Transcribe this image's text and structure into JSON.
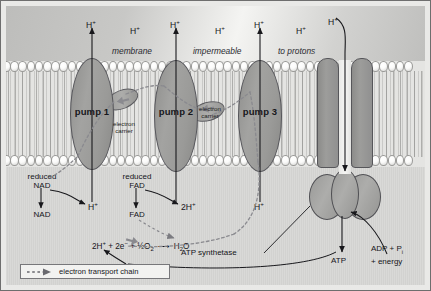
{
  "figure": {
    "colors": {
      "protein_fill": "#9a9a98",
      "protein_stroke": "#55555a",
      "outside_band": "#c8c8c6",
      "matrix_band": "#d5d5d3",
      "membrane_band": "#e4e4e2",
      "text": "#15151a"
    }
  },
  "membrane": {
    "caption_line1": "membrane",
    "caption_line2": "impermeable",
    "caption_line3": "to protons"
  },
  "protons": {
    "outside": [
      {
        "label": "H",
        "charge": "+"
      },
      {
        "label": "H",
        "charge": "+"
      },
      {
        "label": "H",
        "charge": "+"
      },
      {
        "label": "H",
        "charge": "+"
      },
      {
        "label": "H",
        "charge": "+"
      },
      {
        "label": "H",
        "charge": "+"
      },
      {
        "label": "H",
        "charge": "+"
      }
    ],
    "inside": [
      {
        "label": "H",
        "charge": "+"
      },
      {
        "label": "2H",
        "charge": "+"
      },
      {
        "label": "H",
        "charge": "+"
      }
    ]
  },
  "pumps": [
    {
      "name": "pump 1"
    },
    {
      "name": "pump 2"
    },
    {
      "name": "pump 3"
    }
  ],
  "carriers": [
    {
      "line1": "electron",
      "line2": "carrier"
    },
    {
      "line1": "electron",
      "line2": "carrier"
    }
  ],
  "electron": {
    "label": "e",
    "charge": "−"
  },
  "donors": [
    {
      "reduced_line1": "reduced",
      "reduced_line2": "NAD",
      "oxidised": "NAD",
      "product_label": "H",
      "product_charge": "+"
    },
    {
      "reduced_line1": "reduced",
      "reduced_line2": "FAD",
      "oxidised": "FAD",
      "product_label": "2H",
      "product_charge": "+"
    }
  ],
  "water_equation": {
    "reactant1": "2H",
    "reactant1_charge": "+",
    "plus1": "+",
    "reactant2": "2e",
    "reactant2_charge": "−",
    "plus2": "+",
    "reactant3_fraction": "½",
    "reactant3": "O",
    "reactant3_sub": "2",
    "arrow": "⟶",
    "product": "H",
    "product_sub": "2",
    "product_tail": "O"
  },
  "synthetase": {
    "label": "ATP synthetase",
    "output": "ATP",
    "input_line1": "ADP + P",
    "input_sub": "i",
    "input_line2": "+ energy"
  },
  "legend": {
    "text": "electron transport chain"
  }
}
